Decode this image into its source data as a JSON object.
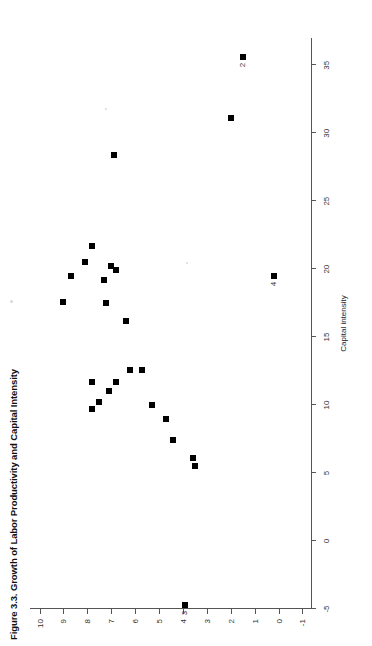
{
  "figure": {
    "title": "Figure 3.3.  Growth of Labor Productivity and Capital Intensity"
  },
  "chart_data": {
    "type": "scatter",
    "title": "Figure 3.3.  Growth of Labor Productivity and Capital Intensity",
    "xlabel": "Capital intensity",
    "ylabel": "Labor productivity (%)",
    "xlim": [
      -5,
      37
    ],
    "ylim": [
      -1.4,
      10.4
    ],
    "grid": false,
    "legend": null,
    "xticks": [
      -5,
      0,
      5,
      10,
      15,
      20,
      25,
      30,
      35
    ],
    "xticklabels": [
      "-5",
      "0",
      "5",
      "10",
      "15",
      "20",
      "25",
      "30",
      "35"
    ],
    "yticks": [
      -1,
      0,
      1,
      2,
      3,
      4,
      5,
      6,
      7,
      8,
      9,
      10
    ],
    "yticklabels": [
      "-1",
      "0",
      "1",
      "2",
      "3",
      "4",
      "5",
      "6",
      "7",
      "8",
      "9",
      "10"
    ],
    "marker": "square",
    "marker_color": "#000000",
    "points": [
      {
        "x": 19.5,
        "y": 8.7,
        "label": ""
      },
      {
        "x": 21.7,
        "y": 7.8,
        "label": ""
      },
      {
        "x": 20.5,
        "y": 8.1,
        "label": ""
      },
      {
        "x": 20.2,
        "y": 7.0,
        "label": ""
      },
      {
        "x": 19.9,
        "y": 6.8,
        "label": ""
      },
      {
        "x": 19.2,
        "y": 7.3,
        "label": ""
      },
      {
        "x": 17.6,
        "y": 9.0,
        "label": ""
      },
      {
        "x": 17.5,
        "y": 7.2,
        "label": ""
      },
      {
        "x": 16.2,
        "y": 6.4,
        "label": ""
      },
      {
        "x": 12.6,
        "y": 5.7,
        "label": ""
      },
      {
        "x": 12.6,
        "y": 6.2,
        "label": ""
      },
      {
        "x": 11.7,
        "y": 7.8,
        "label": ""
      },
      {
        "x": 11.7,
        "y": 6.8,
        "label": ""
      },
      {
        "x": 11.0,
        "y": 7.1,
        "label": ""
      },
      {
        "x": 10.2,
        "y": 7.5,
        "label": ""
      },
      {
        "x": 9.7,
        "y": 7.8,
        "label": ""
      },
      {
        "x": 10.0,
        "y": 5.3,
        "label": ""
      },
      {
        "x": 9.0,
        "y": 4.7,
        "label": ""
      },
      {
        "x": 7.4,
        "y": 4.4,
        "label": ""
      },
      {
        "x": 5.5,
        "y": 3.5,
        "label": ""
      },
      {
        "x": 6.1,
        "y": 3.6,
        "label": ""
      },
      {
        "x": 28.4,
        "y": 6.9,
        "label": ""
      },
      {
        "x": 31.1,
        "y": 2.0,
        "label": ""
      },
      {
        "x": 35.6,
        "y": 1.5,
        "label": "2"
      },
      {
        "x": 19.5,
        "y": 0.2,
        "label": "4"
      },
      {
        "x": -4.7,
        "y": 3.9,
        "label": "3"
      }
    ]
  }
}
